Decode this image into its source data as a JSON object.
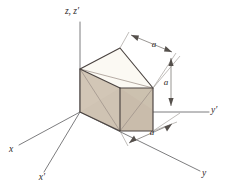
{
  "figure": {
    "background_color": "#ffffff"
  },
  "colors": {
    "face_left": "#cfc3b3",
    "face_right": "#c9bcab",
    "face_top": "#fbf9f3",
    "edge_dark": "#4a4340",
    "edge_light": "#9d9289",
    "axis": "#6e6e70",
    "dimension": "#77736f",
    "text": "#2e2b29"
  },
  "axes": [
    {
      "id": "z-axis",
      "label": "z, z′",
      "label_x": 62,
      "label_y": 13
    },
    {
      "id": "y-prime-axis",
      "label": "y′",
      "label_x": 214,
      "label_y": 110
    },
    {
      "id": "y-axis",
      "label": "y",
      "label_x": 206,
      "label_y": 177
    },
    {
      "id": "x-axis",
      "label": "x",
      "label_x": 10,
      "label_y": 152
    },
    {
      "id": "x-prime-axis",
      "label": "x′",
      "label_x": 41,
      "label_y": 180
    }
  ],
  "dimensions": [
    {
      "id": "dim-top",
      "label": "a",
      "label_x": 154,
      "label_y": 47
    },
    {
      "id": "dim-right",
      "label": "a",
      "label_x": 171,
      "label_y": 83
    },
    {
      "id": "dim-bottom",
      "label": "a",
      "label_x": 152,
      "label_y": 135
    }
  ],
  "cube": {
    "edge_length_label": "a",
    "vertices": {
      "origin_front_bottom": [
        80,
        112
      ],
      "left_bottom": [
        80,
        112
      ],
      "right_bottom": [
        153,
        131
      ],
      "front_bottom": [
        120,
        131
      ],
      "left_top": [
        80,
        69
      ],
      "center_top": [
        120,
        88
      ],
      "right_top": [
        153,
        88
      ],
      "back_top": [
        120,
        48
      ],
      "top_left_far": [
        80,
        69
      ],
      "top_right_far": [
        153,
        88
      ]
    }
  }
}
